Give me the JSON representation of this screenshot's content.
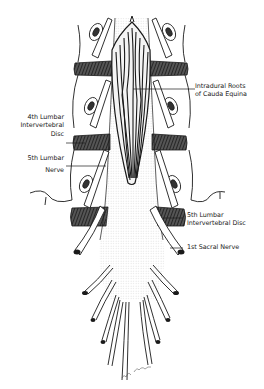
{
  "figure": {
    "labels": {
      "intradural_roots_line1": "Intradural Roots",
      "intradural_roots_line2": "of Cauda Equina",
      "fourth_disc_line1": "4th Lumbar",
      "fourth_disc_line2": "Intervertebral",
      "fourth_disc_line3": "Disc",
      "fifth_nerve_line1": "5th Lumbar",
      "fifth_nerve_line2": "Nerve",
      "fifth_disc_line1": "5th Lumbar",
      "fifth_disc_line2": "Intervertebral Disc",
      "first_sacral": "1st Sacral Nerve"
    },
    "colors": {
      "ink": "#1a1a1a",
      "disc_fill": "#3a3a3a",
      "paper": "#ffffff"
    }
  }
}
